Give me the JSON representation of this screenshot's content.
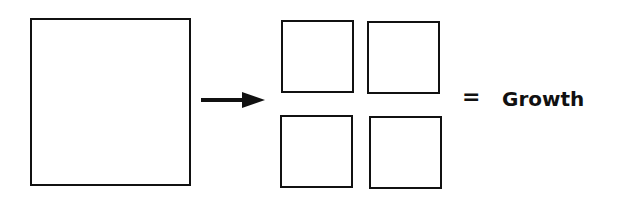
{
  "diagram": {
    "source_shape": "large-square",
    "result_shapes": [
      "small-square",
      "small-square",
      "small-square",
      "small-square"
    ],
    "arrow": "right-arrow",
    "equals_symbol": "=",
    "result_label": "Growth"
  }
}
